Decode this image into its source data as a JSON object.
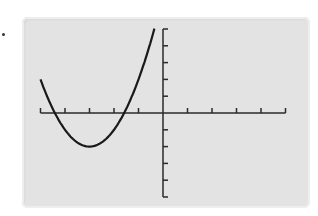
{
  "chart_data": {
    "type": "line",
    "title": "",
    "xlabel": "",
    "ylabel": "",
    "xlim": [
      -5,
      5
    ],
    "ylim": [
      -5,
      5
    ],
    "xticks": [
      -5,
      -4,
      -3,
      -2,
      -1,
      0,
      1,
      2,
      3,
      4,
      5
    ],
    "yticks": [
      -5,
      -4,
      -3,
      -2,
      -1,
      0,
      1,
      2,
      3,
      4,
      5
    ],
    "tick_labels_shown": false,
    "grid": false,
    "series": [
      {
        "name": "parabola",
        "equation": "y = (x + 3)^2 - 2",
        "vertex": [
          -3,
          -2
        ],
        "roots": [
          -4.41,
          -1.59
        ],
        "x": [
          -5,
          -4.5,
          -4,
          -3.5,
          -3,
          -2.5,
          -2,
          -1.5,
          -1,
          -0.5,
          -0.35
        ],
        "y": [
          2,
          0.25,
          -1,
          -1.75,
          -2,
          -1.75,
          -1,
          0.25,
          2,
          4.25,
          5
        ]
      }
    ],
    "colors": {
      "curve": "#1a1a1a",
      "axes": "#2a2a2a",
      "screen": "#e3e3e3"
    }
  }
}
